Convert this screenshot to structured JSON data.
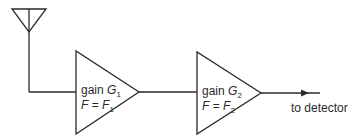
{
  "diagram": {
    "type": "receiver-chain-block-diagram",
    "antenna": {
      "label": ""
    },
    "stages": [
      {
        "gain_prefix": "gain ",
        "gain_symbol": "G",
        "gain_sub": "1",
        "nf_prefix": "F = ",
        "nf_symbol": "F",
        "nf_sub": "1"
      },
      {
        "gain_prefix": "gain ",
        "gain_symbol": "G",
        "gain_sub": "2",
        "nf_prefix": "F = ",
        "nf_symbol": "F",
        "nf_sub": "2"
      }
    ],
    "output_label": "to detector",
    "colors": {
      "line": "#2a2a2a",
      "background": "#ffffff"
    }
  }
}
